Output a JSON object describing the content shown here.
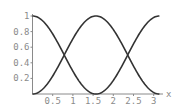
{
  "chart_data": {
    "type": "line",
    "title": "",
    "xlabel": "x",
    "ylabel": "",
    "xlim": [
      0,
      3.14159
    ],
    "ylim": [
      0,
      1
    ],
    "grid": false,
    "legend": null,
    "x_ticks": [
      "0.5",
      "1",
      "1.5",
      "2",
      "2.5",
      "3"
    ],
    "y_ticks": [
      "0.2",
      "0.4",
      "0.6",
      "0.8",
      "1"
    ],
    "series": [
      {
        "name": "cos^2(x)",
        "x": [
          0,
          0.3927,
          0.7854,
          1.1781,
          1.5708,
          1.9635,
          2.3562,
          2.7489,
          3.1416
        ],
        "values": [
          1,
          0.854,
          0.5,
          0.146,
          0,
          0.146,
          0.5,
          0.854,
          1
        ]
      },
      {
        "name": "sin^2(x)",
        "x": [
          0,
          0.3927,
          0.7854,
          1.1781,
          1.5708,
          1.9635,
          2.3562,
          2.7489,
          3.1416
        ],
        "values": [
          0,
          0.146,
          0.5,
          0.854,
          1,
          0.854,
          0.5,
          0.146,
          0
        ]
      }
    ],
    "colors": {
      "curve": "#333333",
      "axis": "#8a8a8a",
      "label": "#8a8a8a"
    }
  },
  "axis": {
    "x_label": "x",
    "x_ticks": [
      {
        "label": "0.5",
        "value": 0.5
      },
      {
        "label": "1",
        "value": 1
      },
      {
        "label": "1.5",
        "value": 1.5
      },
      {
        "label": "2",
        "value": 2
      },
      {
        "label": "2.5",
        "value": 2.5
      },
      {
        "label": "3",
        "value": 3
      }
    ],
    "y_ticks": [
      {
        "label": "0.2",
        "value": 0.2
      },
      {
        "label": "0.4",
        "value": 0.4
      },
      {
        "label": "0.6",
        "value": 0.6
      },
      {
        "label": "0.8",
        "value": 0.8
      },
      {
        "label": "1",
        "value": 1
      }
    ]
  }
}
